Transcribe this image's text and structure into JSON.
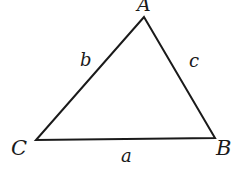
{
  "diagram": {
    "type": "triangle",
    "stroke_color": "#1a1a1a",
    "vertices": [
      {
        "label": "A",
        "x": 144,
        "y": 17
      },
      {
        "label": "B",
        "x": 215,
        "y": 138
      },
      {
        "label": "C",
        "x": 36,
        "y": 140
      }
    ],
    "sides": [
      {
        "label": "a",
        "from": "C",
        "to": "B"
      },
      {
        "label": "b",
        "from": "C",
        "to": "A"
      },
      {
        "label": "c",
        "from": "A",
        "to": "B"
      }
    ]
  },
  "labels": {
    "vertex_a": "A",
    "vertex_b": "B",
    "vertex_c": "C",
    "side_a": "a",
    "side_b": "b",
    "side_c": "c"
  }
}
